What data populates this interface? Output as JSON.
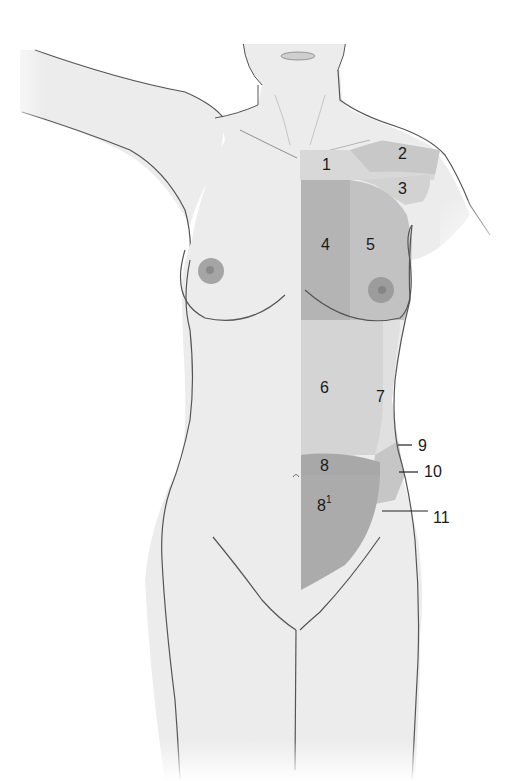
{
  "figure": {
    "colors": {
      "background": "#ffffff",
      "skin": "#ececec",
      "skin_shadow": "#d9d9d9",
      "outline": "#555555",
      "zone_light": "#d6d6d6",
      "zone_mid": "#c4c4c4",
      "zone_dark": "#a9a9a9",
      "areola": "#9a9a9a",
      "label_text": "#1a1a1a"
    },
    "labels": [
      {
        "id": "1",
        "text": "1",
        "x": 322,
        "y": 157
      },
      {
        "id": "2",
        "text": "2",
        "x": 398,
        "y": 146
      },
      {
        "id": "3",
        "text": "3",
        "x": 398,
        "y": 181
      },
      {
        "id": "4",
        "text": "4",
        "x": 321,
        "y": 237
      },
      {
        "id": "5",
        "text": "5",
        "x": 366,
        "y": 237
      },
      {
        "id": "6",
        "text": "6",
        "x": 320,
        "y": 380
      },
      {
        "id": "7",
        "text": "7",
        "x": 376,
        "y": 389
      },
      {
        "id": "8",
        "text": "8",
        "x": 320,
        "y": 458
      },
      {
        "id": "8-1",
        "text": "8",
        "sup": "1",
        "x": 317,
        "y": 497
      },
      {
        "id": "9",
        "text": "9",
        "x": 418,
        "y": 438
      },
      {
        "id": "10",
        "text": "10",
        "x": 424,
        "y": 464
      },
      {
        "id": "11",
        "text": "11",
        "x": 433,
        "y": 510
      }
    ],
    "leader_lines": [
      {
        "for": "9",
        "x1": 398,
        "y1": 445,
        "x2": 412,
        "y2": 445
      },
      {
        "for": "10",
        "x1": 399,
        "y1": 472,
        "x2": 418,
        "y2": 472
      },
      {
        "for": "11",
        "x1": 382,
        "y1": 511,
        "x2": 428,
        "y2": 511
      }
    ]
  }
}
